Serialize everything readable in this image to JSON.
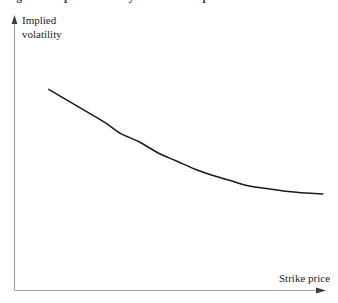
{
  "figure": {
    "caption": "Figure 1  Implied volatility versus strike price",
    "background_color": "#ffffff"
  },
  "axes": {
    "y_label_line1": "Implied",
    "y_label_line2": "volatility",
    "x_label": "Strike price",
    "axis_color": "#a3a3a3",
    "arrow_color": "#3d3d3d",
    "text_color": "#1c1c1c"
  },
  "chart_data": {
    "type": "line",
    "title": "Implied volatility versus strike price",
    "xlabel": "Strike price",
    "ylabel": "Implied volatility",
    "grid": false,
    "legend": null,
    "axis_ticks": {
      "x": [],
      "y": []
    },
    "xlim": [
      0,
      1
    ],
    "ylim": [
      0,
      1
    ],
    "curve_color": "#1a1a1a",
    "series": [
      {
        "name": "Implied volatility skew",
        "description": "Monotonically decreasing convex curve (volatility skew): high implied volatility at low strikes, flattening toward high strikes.",
        "x": [
          0.11,
          0.17,
          0.23,
          0.29,
          0.34,
          0.4,
          0.46,
          0.52,
          0.58,
          0.63,
          0.69,
          0.75,
          0.81,
          0.87,
          0.92,
          0.99
        ],
        "y": [
          0.73,
          0.69,
          0.65,
          0.61,
          0.57,
          0.54,
          0.5,
          0.47,
          0.44,
          0.42,
          0.4,
          0.38,
          0.37,
          0.36,
          0.355,
          0.35
        ]
      }
    ]
  }
}
